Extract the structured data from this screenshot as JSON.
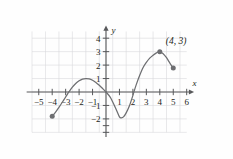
{
  "chart_data": {
    "type": "line",
    "title": "",
    "xlabel": "x",
    "ylabel": "y",
    "xlim": [
      -5.9,
      6.4
    ],
    "ylim": [
      -3.4,
      4.7
    ],
    "grid": true,
    "grid_color": "#d9d9dc",
    "axis_color": "#58595b",
    "curve_color": "#6d6e71",
    "legend": "none",
    "x_ticks": [
      -5,
      -4,
      -3,
      -2,
      -1,
      1,
      2,
      3,
      4,
      5,
      6
    ],
    "x_tick_labels": [
      "−5",
      "−4",
      "−3",
      "−2",
      "−1",
      "1",
      "2",
      "3",
      "4",
      "5",
      "6"
    ],
    "y_ticks": [
      -2,
      -1,
      1,
      2,
      3,
      4
    ],
    "y_tick_labels": [
      "−2",
      "−1",
      "1",
      "2",
      "3",
      "4"
    ],
    "series": [
      {
        "name": "curve",
        "points": [
          [
            -4.0,
            -1.8
          ],
          [
            -3.75,
            -1.5
          ],
          [
            -3.5,
            -1.14
          ],
          [
            -3.25,
            -0.76
          ],
          [
            -3.0,
            -0.37
          ],
          [
            -2.9,
            -0.21
          ],
          [
            -2.75,
            0.02
          ],
          [
            -2.5,
            0.36
          ],
          [
            -2.25,
            0.63
          ],
          [
            -2.0,
            0.83
          ],
          [
            -1.75,
            0.96
          ],
          [
            -1.5,
            1.0
          ],
          [
            -1.25,
            0.97
          ],
          [
            -1.0,
            0.87
          ],
          [
            -0.75,
            0.71
          ],
          [
            -0.5,
            0.5
          ],
          [
            -0.25,
            0.26
          ],
          [
            0.0,
            0.0
          ],
          [
            0.3,
            -0.36
          ],
          [
            0.5,
            -0.74
          ],
          [
            0.75,
            -1.28
          ],
          [
            1.0,
            -1.85
          ],
          [
            1.15,
            -1.92
          ],
          [
            1.3,
            -1.85
          ],
          [
            1.5,
            -1.55
          ],
          [
            1.75,
            -1.0
          ],
          [
            2.0,
            -0.25
          ],
          [
            2.1,
            0.08
          ],
          [
            2.25,
            0.55
          ],
          [
            2.5,
            1.22
          ],
          [
            2.75,
            1.8
          ],
          [
            3.0,
            2.2
          ],
          [
            3.25,
            2.52
          ],
          [
            3.5,
            2.74
          ],
          [
            3.75,
            2.91
          ],
          [
            4.0,
            3.0
          ],
          [
            4.25,
            2.85
          ],
          [
            4.5,
            2.55
          ],
          [
            4.75,
            2.15
          ],
          [
            5.0,
            1.78
          ]
        ]
      }
    ],
    "markers": [
      {
        "name": "left-endpoint",
        "x": -4.0,
        "y": -1.8,
        "style": "filled-circle",
        "label": ""
      },
      {
        "name": "peak-point",
        "x": 4.0,
        "y": 3.0,
        "style": "filled-circle",
        "label": "(4, 3)"
      },
      {
        "name": "right-endpoint",
        "x": 5.0,
        "y": 1.78,
        "style": "filled-circle",
        "label": ""
      }
    ],
    "annotations": [
      {
        "name": "peak-coordinate-label",
        "text": "(4, 3)",
        "x": 4.45,
        "y": 3.6
      }
    ]
  },
  "axes": {
    "x_axis_name": "x",
    "y_axis_name": "y"
  }
}
